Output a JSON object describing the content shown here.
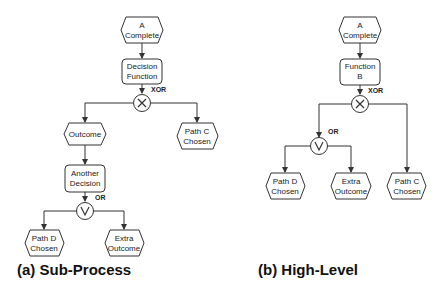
{
  "panels": {
    "a": {
      "caption": "(a) Sub-Process",
      "nodes": {
        "start": {
          "line1": "A",
          "line2": "Complete"
        },
        "func": {
          "line1": "Decision",
          "line2": "Function"
        },
        "xor_label": "XOR",
        "outcome": {
          "line1": "Outcome"
        },
        "pathc": {
          "line1": "Path C",
          "line2": "Chosen"
        },
        "another": {
          "line1": "Another",
          "line2": "Decision"
        },
        "or_label": "OR",
        "pathd": {
          "line1": "Path D",
          "line2": "Chosen"
        },
        "extra": {
          "line1": "Extra",
          "line2": "Outcome"
        }
      }
    },
    "b": {
      "caption": "(b) High-Level",
      "nodes": {
        "start": {
          "line1": "A",
          "line2": "Complete"
        },
        "func": {
          "line1": "Function",
          "line2": "B"
        },
        "xor_label": "XOR",
        "or_label": "OR",
        "pathd": {
          "line1": "Path D",
          "line2": "Chosen"
        },
        "extra": {
          "line1": "Extra",
          "line2": "Outcome"
        },
        "pathc": {
          "line1": "Path C",
          "line2": "Chosen"
        }
      }
    }
  }
}
